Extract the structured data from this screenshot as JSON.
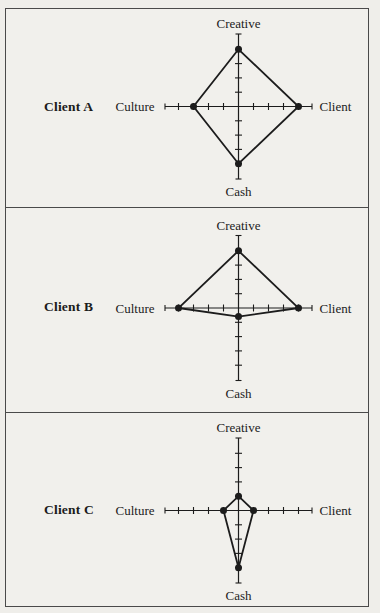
{
  "figure": {
    "background_color": "#f1f0ec",
    "line_color": "#1c1c1c",
    "border_color": "#4a4a4a"
  },
  "chart_data": [
    {
      "type": "radar",
      "name": "Client A",
      "axes": {
        "top": "Creative",
        "right": "Client",
        "bottom": "Cash",
        "left": "Culture"
      },
      "values": {
        "creative": 4,
        "client": 4,
        "cash": 4,
        "culture": 3
      },
      "axis_ticks": [
        1,
        2,
        3,
        4
      ],
      "axis_max": 5,
      "legend": "none",
      "grid": "ticks-only"
    },
    {
      "type": "radar",
      "name": "Client B",
      "axes": {
        "top": "Creative",
        "right": "Client",
        "bottom": "Cash",
        "left": "Culture"
      },
      "values": {
        "creative": 4,
        "client": 4,
        "cash": 0.6,
        "culture": 4
      },
      "axis_ticks": [
        1,
        2,
        3,
        4
      ],
      "axis_max": 5,
      "legend": "none",
      "grid": "ticks-only"
    },
    {
      "type": "radar",
      "name": "Client C",
      "axes": {
        "top": "Creative",
        "right": "Client",
        "bottom": "Cash",
        "left": "Culture"
      },
      "values": {
        "creative": 1,
        "client": 1,
        "cash": 4,
        "culture": 1
      },
      "axis_ticks": [
        1,
        2,
        3,
        4
      ],
      "axis_max": 5,
      "legend": "none",
      "grid": "ticks-only"
    }
  ]
}
